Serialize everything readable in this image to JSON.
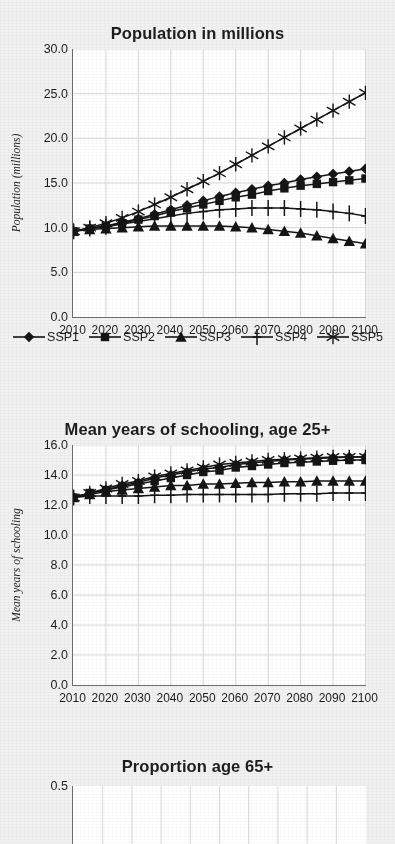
{
  "page": {
    "background": "#f1f1f1",
    "ink": "#1a1a1a",
    "plot_background": "#ffffff",
    "grid_color": "#d9d9d9",
    "axis_color": "#6f6f6f"
  },
  "legend": {
    "position": "below-chart-1",
    "items": [
      {
        "label": "SSP1",
        "marker": "diamond-marker"
      },
      {
        "label": "SSP2",
        "marker": "square-marker"
      },
      {
        "label": "SSP3",
        "marker": "triangle-marker"
      },
      {
        "label": "SSP4",
        "marker": "plus-marker"
      },
      {
        "label": "SSP5",
        "marker": "asterisk-marker"
      }
    ]
  },
  "chart_data": [
    {
      "id": "population",
      "type": "line",
      "title": "Population in millions",
      "xlabel": "",
      "ylabel": "Population (millions)",
      "x": [
        2010,
        2015,
        2020,
        2025,
        2030,
        2035,
        2040,
        2045,
        2050,
        2055,
        2060,
        2065,
        2070,
        2075,
        2080,
        2085,
        2090,
        2095,
        2100
      ],
      "xticks": [
        2010,
        2020,
        2030,
        2040,
        2050,
        2060,
        2070,
        2080,
        2090,
        2100
      ],
      "xlim": [
        2010,
        2100
      ],
      "ylim": [
        0.0,
        30.0
      ],
      "yticks": [
        "0.0",
        "5.0",
        "10.0",
        "15.0",
        "20.0",
        "25.0",
        "30.0"
      ],
      "grid": true,
      "series": [
        {
          "name": "SSP1",
          "marker": "diamond-marker",
          "values": [
            9.6,
            9.9,
            10.2,
            10.6,
            11.0,
            11.5,
            12.0,
            12.5,
            13.0,
            13.5,
            13.9,
            14.3,
            14.7,
            15.0,
            15.4,
            15.7,
            16.0,
            16.3,
            16.6
          ]
        },
        {
          "name": "SSP2",
          "marker": "square-marker",
          "values": [
            9.6,
            9.9,
            10.2,
            10.5,
            10.9,
            11.3,
            11.8,
            12.2,
            12.6,
            13.0,
            13.4,
            13.7,
            14.1,
            14.4,
            14.7,
            14.9,
            15.1,
            15.3,
            15.5
          ]
        },
        {
          "name": "SSP3",
          "marker": "triangle-marker",
          "values": [
            9.6,
            9.8,
            9.9,
            10.0,
            10.1,
            10.2,
            10.2,
            10.2,
            10.2,
            10.2,
            10.1,
            10.0,
            9.8,
            9.6,
            9.4,
            9.1,
            8.8,
            8.5,
            8.2
          ]
        },
        {
          "name": "SSP4",
          "marker": "plus-marker",
          "values": [
            9.6,
            9.9,
            10.1,
            10.4,
            10.7,
            11.0,
            11.3,
            11.6,
            11.8,
            12.0,
            12.1,
            12.2,
            12.2,
            12.2,
            12.1,
            12.0,
            11.8,
            11.6,
            11.3
          ]
        },
        {
          "name": "SSP5",
          "marker": "asterisk-marker",
          "values": [
            9.6,
            10.0,
            10.5,
            11.1,
            11.8,
            12.6,
            13.4,
            14.3,
            15.2,
            16.1,
            17.1,
            18.1,
            19.1,
            20.1,
            21.1,
            22.1,
            23.1,
            24.1,
            25.1
          ]
        }
      ]
    },
    {
      "id": "schooling",
      "type": "line",
      "title": "Mean years of schooling, age 25+",
      "xlabel": "",
      "ylabel": "Mean years of schooling",
      "x": [
        2010,
        2015,
        2020,
        2025,
        2030,
        2035,
        2040,
        2045,
        2050,
        2055,
        2060,
        2065,
        2070,
        2075,
        2080,
        2085,
        2090,
        2095,
        2100
      ],
      "xticks": [
        2010,
        2020,
        2030,
        2040,
        2050,
        2060,
        2070,
        2080,
        2090,
        2100
      ],
      "xlim": [
        2010,
        2100
      ],
      "ylim": [
        0.0,
        16.0
      ],
      "yticks": [
        "0.0",
        "2.0",
        "4.0",
        "6.0",
        "8.0",
        "10.0",
        "12.0",
        "14.0",
        "16.0"
      ],
      "grid": true,
      "series": [
        {
          "name": "SSP1",
          "marker": "diamond-marker",
          "values": [
            12.5,
            12.8,
            13.0,
            13.3,
            13.5,
            13.8,
            14.0,
            14.2,
            14.4,
            14.5,
            14.7,
            14.8,
            14.9,
            15.0,
            15.05,
            15.1,
            15.15,
            15.2,
            15.2
          ]
        },
        {
          "name": "SSP2",
          "marker": "square-marker",
          "values": [
            12.5,
            12.8,
            13.0,
            13.2,
            13.4,
            13.6,
            13.8,
            14.0,
            14.2,
            14.3,
            14.5,
            14.6,
            14.7,
            14.8,
            14.85,
            14.9,
            14.95,
            15.0,
            15.0
          ]
        },
        {
          "name": "SSP3",
          "marker": "triangle-marker",
          "values": [
            12.5,
            12.7,
            12.9,
            13.0,
            13.1,
            13.2,
            13.3,
            13.3,
            13.4,
            13.4,
            13.45,
            13.5,
            13.5,
            13.55,
            13.55,
            13.6,
            13.6,
            13.6,
            13.6
          ]
        },
        {
          "name": "SSP4",
          "marker": "plus-marker",
          "values": [
            12.5,
            12.6,
            12.6,
            12.6,
            12.6,
            12.65,
            12.65,
            12.7,
            12.7,
            12.7,
            12.7,
            12.7,
            12.7,
            12.75,
            12.75,
            12.75,
            12.8,
            12.8,
            12.8
          ]
        },
        {
          "name": "SSP5",
          "marker": "asterisk-marker",
          "values": [
            12.5,
            12.8,
            13.1,
            13.4,
            13.6,
            13.9,
            14.1,
            14.3,
            14.5,
            14.7,
            14.8,
            14.9,
            15.0,
            15.05,
            15.1,
            15.15,
            15.2,
            15.2,
            15.2
          ]
        }
      ]
    },
    {
      "id": "proportion65",
      "type": "line",
      "title": "Proportion age 65+",
      "xlabel": "",
      "ylabel": "",
      "xticks": [],
      "ylim": [
        0.0,
        0.5
      ],
      "yticks": [
        "0.5"
      ],
      "grid": true,
      "note": "cropped-at-bottom-of-screenshot",
      "series": []
    }
  ]
}
